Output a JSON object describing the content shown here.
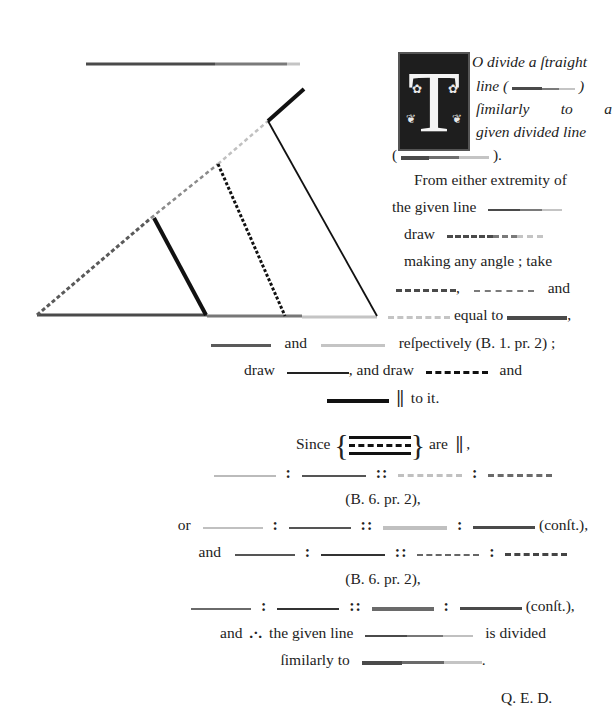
{
  "page": {
    "proposition": "Book 6, Proposition 10",
    "colors": {
      "dark": "#4a4a4a",
      "medium": "#7a7a7a",
      "light": "#bdbdbd",
      "black": "#111111",
      "ink": "#222222"
    }
  },
  "figure": {
    "top_line": {
      "label": "given divided line",
      "segments": [
        "dark",
        "medium",
        "light"
      ]
    },
    "base_line": {
      "label": "given line",
      "segments": [
        "dark",
        "medium",
        "light"
      ]
    },
    "oblique_line": {
      "label": "line drawn making any angle",
      "style": "dashed"
    },
    "parallel_1": {
      "style": "thick-solid"
    },
    "parallel_2": {
      "style": "dotted"
    },
    "joining_line": {
      "style": "thin-solid"
    },
    "extension": {
      "style": "thick-solid"
    }
  },
  "drop_cap": {
    "letter": "T"
  },
  "intro": {
    "line1": "O divide a ſtraight",
    "line2_prefix": "line (",
    "line2_suffix": ")",
    "line3_a": "ſimilarly",
    "line3_b": "to",
    "line3_c": "a",
    "line4": "given divided line",
    "line5_prefix": "(",
    "line5_suffix": ")."
  },
  "body": {
    "l1": "From either extremity of",
    "l2": "the given line",
    "l3": "draw",
    "l4": "making any angle ;  take",
    "l5_comma": ",",
    "l5_and": "and",
    "l6": "equal to",
    "l6_comma": ",",
    "l7_and": "and",
    "l7_rest": "reſpectively (B. 1. pr. 2) ;",
    "l8_draw": "draw",
    "l8_mid": ", and draw",
    "l8_and": "and",
    "l9_parallel": "||",
    "l9_rest": "to it.",
    "l10_since": "Since",
    "l10_are": "are",
    "l10_parallel": "||",
    "l10_comma": ",",
    "ratio_colon": ":",
    "ratio_proportion": "::",
    "ref1": "(B. 6. pr. 2),",
    "l13_or": "or",
    "conft": "(conſt.),",
    "l14_and": "and",
    "ref2": "(B. 6. pr. 2),",
    "l17_and": "and",
    "therefore": ".·.",
    "l17_rest": "the given line",
    "l17_end": "is divided",
    "l18": "ſimilarly to",
    "l18_end": ".",
    "qed": "Q. E. D."
  }
}
